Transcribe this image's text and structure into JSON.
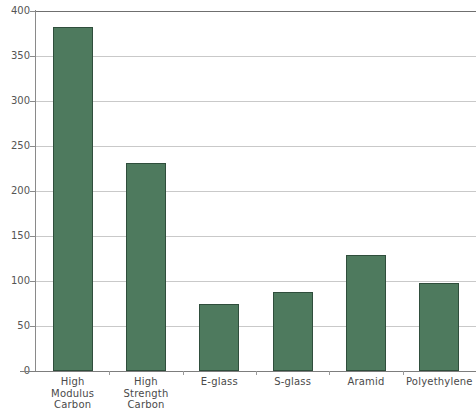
{
  "chart_data": {
    "type": "bar",
    "title": "",
    "subtitle": "",
    "xlabel": "",
    "ylabel": "",
    "categories": [
      "High Modulus Carbon",
      "High Strength Carbon",
      "E-glass",
      "S-glass",
      "Aramid",
      "Polyethylene"
    ],
    "category_lines": [
      [
        "High",
        "Modulus",
        "Carbon"
      ],
      [
        "High",
        "Strength",
        "Carbon"
      ],
      [
        "E-glass"
      ],
      [
        "S-glass"
      ],
      [
        "Aramid"
      ],
      [
        "Polyethylene"
      ]
    ],
    "values": [
      382,
      231,
      75,
      88,
      129,
      98
    ],
    "ylim": [
      0,
      400
    ],
    "ytick_labels": [
      "400",
      "350",
      "300",
      "250",
      "200",
      "150",
      "100",
      "50",
      "0"
    ],
    "ytick_values": [
      400,
      350,
      300,
      250,
      200,
      150,
      100,
      50,
      0
    ],
    "grid": true,
    "legend": false,
    "legend_position": "none",
    "bar_fill_color": "#4e7a5e",
    "bar_border_color": "#2f4e3c",
    "gridline_color": "#c9c9c9",
    "axis_color": "#8a8a8a",
    "tick_label_color": "#555555",
    "background_color": "#ffffff"
  }
}
